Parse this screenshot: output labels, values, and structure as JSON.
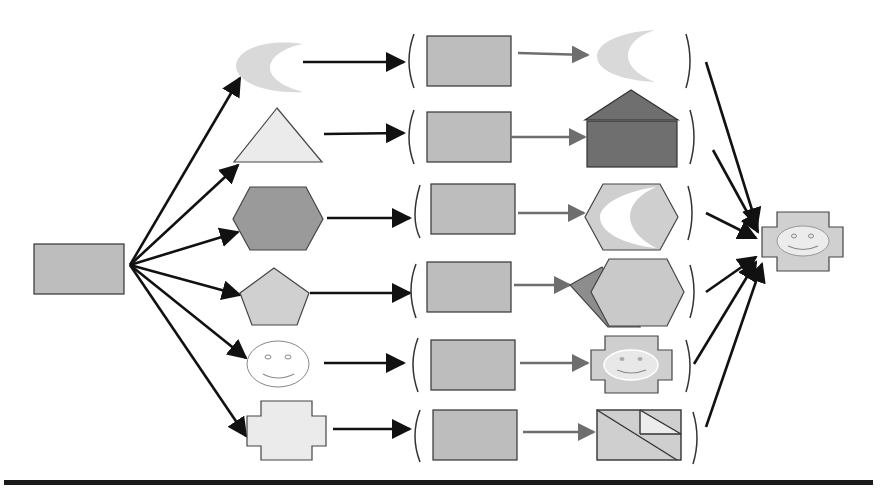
{
  "diagram": {
    "title": "",
    "colors": {
      "stroke": "#333333",
      "arrow": "#111111",
      "arrow_gray": "#6e6e6e",
      "rect_fill": "#bdbdbd",
      "light": "#d9d9d9",
      "lighter": "#e8e8e8",
      "dark": "#6f6f6f",
      "mid": "#9a9a9a",
      "white": "#ffffff",
      "rule": "#1a1a1a"
    },
    "source": {
      "shape": "rectangle",
      "x": 34,
      "y": 244,
      "w": 90,
      "h": 50,
      "fill": "#bdbdbd"
    },
    "rows": [
      {
        "id": "moon",
        "input_shape": "crescent",
        "cy": 63,
        "middle": {
          "x": 427,
          "y": 36,
          "w": 84,
          "h": 50
        },
        "result_shape": "crescent",
        "left_bracket_x": 412,
        "right_bracket_x": 688
      },
      {
        "id": "triangle",
        "input_shape": "triangle",
        "cy": 137,
        "middle": {
          "x": 427,
          "y": 112,
          "w": 84,
          "h": 50
        },
        "result_shape": "house",
        "left_bracket_x": 412,
        "right_bracket_x": 692
      },
      {
        "id": "hexagon",
        "input_shape": "hexagon",
        "cy": 218,
        "middle": {
          "x": 431,
          "y": 184,
          "w": 84,
          "h": 50
        },
        "result_shape": "hexagon-with-crescent",
        "left_bracket_x": 418,
        "right_bracket_x": 690
      },
      {
        "id": "pentagon",
        "input_shape": "pentagon",
        "cy": 294,
        "middle": {
          "x": 427,
          "y": 262,
          "w": 84,
          "h": 50
        },
        "result_shape": "overlapping-hexagons",
        "left_bracket_x": 416,
        "right_bracket_x": 690
      },
      {
        "id": "smiley",
        "input_shape": "smiley",
        "cy": 362,
        "middle": {
          "x": 431,
          "y": 340,
          "w": 84,
          "h": 50
        },
        "result_shape": "cross-with-smiley",
        "left_bracket_x": 418,
        "right_bracket_x": 688
      },
      {
        "id": "cross",
        "input_shape": "cross",
        "cy": 430,
        "middle": {
          "x": 433,
          "y": 410,
          "w": 84,
          "h": 50
        },
        "result_shape": "triangulated-rectangle",
        "left_bracket_x": 418,
        "right_bracket_x": 694
      }
    ],
    "output": {
      "shape": "cross-with-smiley",
      "cx": 802,
      "cy": 241
    },
    "bottom_rule": {
      "y": 480,
      "thickness": 5
    }
  }
}
